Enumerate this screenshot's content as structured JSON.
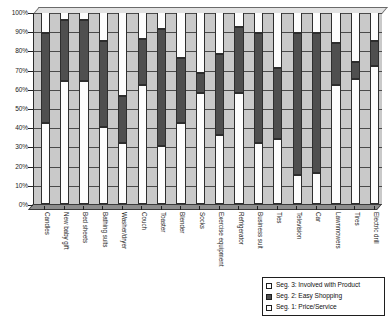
{
  "chart_data": {
    "type": "bar",
    "subtype": "stacked-100-percent",
    "title": "",
    "xlabel": "",
    "ylabel": "",
    "ylim": [
      0,
      100
    ],
    "ytick_labels": [
      "100%",
      "90%",
      "80%",
      "70%",
      "60%",
      "50%",
      "40%",
      "30%",
      "20%",
      "10%",
      "0%"
    ],
    "ytick_values": [
      100,
      90,
      80,
      70,
      60,
      50,
      40,
      30,
      20,
      10,
      0
    ],
    "grid": true,
    "legend_position": "bottom-right",
    "categories": [
      "Candles",
      "New baby gift",
      "Bed sheets",
      "Bathing suits",
      "Washer/dryer",
      "Couch",
      "Toaster",
      "Blender",
      "Socks",
      "Exercise equipment",
      "Refrigerator",
      "Business suit",
      "Ties",
      "Television",
      "Car",
      "Lawnmowers",
      "Tires",
      "Electric drill"
    ],
    "series": [
      {
        "name": "Seg. 1: Price/Service",
        "color": "#fdfdfd",
        "values": [
          42,
          64,
          64,
          40,
          32,
          62,
          30,
          42,
          58,
          36,
          58,
          32,
          34,
          15,
          16,
          62,
          65,
          72
        ]
      },
      {
        "name": "Seg. 2: Easy Shopping",
        "color": "#4f4f4f",
        "values": [
          47,
          32,
          32,
          45,
          24,
          24,
          61,
          34,
          10,
          42,
          34,
          57,
          37,
          74,
          73,
          22,
          9,
          13
        ]
      },
      {
        "name": "Seg. 3: Involved with Product",
        "color": "#fdfdfd",
        "values": [
          11,
          4,
          4,
          15,
          44,
          14,
          9,
          24,
          32,
          22,
          8,
          11,
          29,
          11,
          11,
          16,
          26,
          15
        ]
      }
    ],
    "cumulative_tops": {
      "seg1": [
        42,
        64,
        64,
        40,
        32,
        62,
        30,
        42,
        58,
        36,
        58,
        32,
        34,
        15,
        16,
        62,
        65,
        72
      ],
      "seg2": [
        89,
        96,
        96,
        85,
        56,
        86,
        91,
        76,
        68,
        78,
        92,
        89,
        71,
        89,
        89,
        84,
        74,
        85
      ],
      "seg3": [
        100,
        100,
        100,
        100,
        100,
        100,
        100,
        100,
        100,
        100,
        100,
        100,
        100,
        100,
        100,
        100,
        100,
        100
      ]
    }
  },
  "legend": {
    "items": [
      {
        "label": "Seg. 3: Involved with Product",
        "swatch": "#fdfdfd"
      },
      {
        "label": "Seg. 2: Easy Shopping",
        "swatch": "#4f4f4f"
      },
      {
        "label": "Seg. 1: Price/Service",
        "swatch": "#fdfdfd"
      }
    ]
  },
  "colors": {
    "plot_background": "#c9c9c9",
    "segment_light": "#fdfdfd",
    "segment_dark": "#4f4f4f",
    "axis": "#2a2a2a"
  }
}
